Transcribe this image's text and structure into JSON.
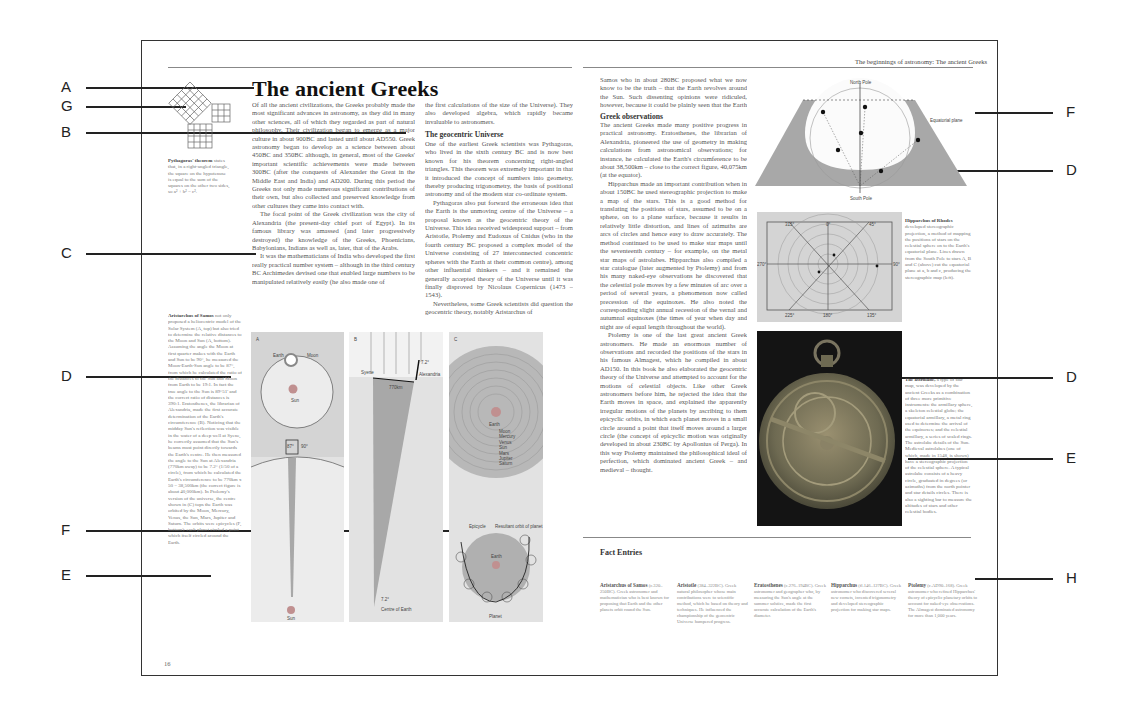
{
  "callouts_left": [
    {
      "letter": "A",
      "y": 87
    },
    {
      "letter": "G",
      "y": 106
    },
    {
      "letter": "B",
      "y": 132
    },
    {
      "letter": "C",
      "y": 253
    },
    {
      "letter": "D",
      "y": 376
    },
    {
      "letter": "F",
      "y": 530
    },
    {
      "letter": "E",
      "y": 575
    }
  ],
  "callouts_right": [
    {
      "letter": "F",
      "y": 112
    },
    {
      "letter": "D",
      "y": 170
    },
    {
      "letter": "D",
      "y": 377
    },
    {
      "letter": "E",
      "y": 458
    },
    {
      "letter": "H",
      "y": 578
    }
  ],
  "left_page": {
    "title": "The ancient Greeks",
    "page_number": "16",
    "intro_col1": "Of all the ancient civilizations, the Greeks probably made the most significant advances in astronomy, as they did in many other sciences, all of which they regarded as part of natural philosophy. Their civilization began to emerge as a major culture in about 900BC and lasted until about AD550. Greek astronomy began to develop as a science between about 450BC and 350BC although, in general, most of the Greeks' important scientific achievements were made between 300BC (after the conquests of Alexander the Great in the Middle East and India) and AD200. During this period the Greeks not only made numerous significant contributions of their own, but also collected and preserved knowledge from other cultures they came into contact with.",
    "intro_col1_p2": "The focal point of the Greek civilization was the city of Alexandria (the present-day chief port of Egypt). In its famous library was amassed (and later progressively destroyed) the knowledge of the Greeks, Phoenicians, Babylonians, Indians as well as, later, that of the Arabs.",
    "intro_col1_p3": "It was the mathematicians of India who developed the first really practical number system – although in the third century BC Archimedes devised one that enabled large numbers to be manipulated relatively easily (he also made one of",
    "col2_p1": "the first calculations of the size of the Universe). They also developed algebra, which rapidly became invaluable to astronomers.",
    "col2_heading": "The geocentric Universe",
    "col2_p2": "One of the earliest Greek scientists was Pythagoras, who lived in the sixth century BC and is now best known for his theorem concerning right-angled triangles. This theorem was extremely important in that it introduced the concept of numbers into geometry, thereby producing trigonometry, the basis of positional astronomy and of the modern star co-ordinate system.",
    "col2_p3": "Pythagoras also put forward the erroneous idea that the Earth is the unmoving centre of the Universe – a proposal known as the geocentric theory of the Universe. This idea received widespread support – from Aristotle, Ptolemy and Eudoxus of Cnidus (who in the fourth century BC proposed a complex model of the Universe consisting of 27 interconnected concentric spheres with the Earth at their common centre), among other influential thinkers – and it remained the generally accepted theory of the Universe until it was finally disproved by Nicolaus Copernicus (1473 – 1543).",
    "col2_p4": "Nevertheless, some Greek scientists did question the geocentric theory, notably Aristarchus of",
    "pythagoras_caption_title": "Pythagoras' theorem",
    "pythagoras_caption": "states that, in a right-angled triangle, the square on the hypotenuse is equal to the sum of the squares on the other two sides, so a² + b² = c².",
    "aristarchus_caption_title": "Aristarchus of Samos",
    "aristarchus_caption": "not only proposed a heliocentric model of the Solar System (A, top) but also tried to determine the relative distances to the Moon and Sun (A, bottom). Assuming the angle the Moon at first quarter makes with the Earth and Sun to be 90°, he measured the Moon-Earth-Sun angle to be 87°, from which he calculated the ratio of the distances to the Sun and Moon from Earth to be 19:1. In fact the true angle to the Sun is 89°51' and the correct ratio of distances is 390:1. Eratosthenes, the librarian of Alexandria, made the first accurate determination of the Earth's circumference (B). Noticing that the midday Sun's reflection was visible in the water of a deep well at Syene, he correctly assumed that the Sun's beams must point directly towards the Earth's centre. He then measured the angle to the Sun at Alexandria (770km away) to be 7.2° (1/50 of a circle), from which he calculated the Earth's circumference to be 770km x 50 = 38,500km (the correct figure is about 40,000km). In Ptolemy's version of the universe, the centre shown in (C) tops the Earth was orbited by the Moon, Mercury, Venus, the Sun, Mars, Jupiter and Saturn. The orbits were epicycles (F, bottom): each planet circled a point which itself circled around the Earth.",
    "diagram_panels": [
      {
        "id": "A",
        "labels": [
          "Earth",
          "Moon",
          "Sun",
          "87°",
          "90°",
          "Earth",
          "Moon",
          "Sun"
        ]
      },
      {
        "id": "B",
        "labels": [
          "Syene",
          "7.2°",
          "Alexandria",
          "770km",
          "7.2°",
          "Centre of Earth"
        ]
      },
      {
        "id": "C",
        "labels": [
          "Earth",
          "Moon",
          "Mercury",
          "Venus",
          "Sun",
          "Mars",
          "Jupiter",
          "Saturn",
          "Epicycle",
          "Resultant orbit of planet",
          "Earth",
          "Planet"
        ]
      }
    ]
  },
  "right_page": {
    "running_head": "The beginnings of astronomy: The ancient Greeks",
    "col1_p1": "Samos who in about 280BC proposed what we now know to be the truth – that the Earth revolves around the Sun. Such dissenting opinions were ridiculed, however, because it could be plainly seen that the Earth was stationary and that the celestial bodies revolved around it.",
    "col1_heading": "Greek observations",
    "col1_p2": "The ancient Greeks made many positive progress in practical astronomy. Eratosthenes, the librarian of Alexandria, pioneered the use of geometry in making calculations from astronomical observations; for instance, he calculated the Earth's circumference to be about 38,500km – close to the correct figure, 40,075km (at the equator).",
    "col1_p3": "Hipparchus made an important contribution when in about 150BC he used stereographic projection to make a map of the stars. This is a good method for translating the positions of stars, assumed to be on a sphere, on to a plane surface, because it results in relatively little distortion, and lines of azimuths are arcs of circles and hence easy to draw accurately. The method continued to be used to make star maps until the seventeenth century – for example, on the metal star maps of astrolabes. Hipparchus also compiled a star catalogue (later augmented by Ptolemy) and from his many naked-eye observations he discovered that the celestial pole moves by a few minutes of arc over a period of several years, a phenomenon now called precession of the equinoxes. He also noted the corresponding slight annual recession of the vernal and autumnal equinoxes (the times of year when day and night are of equal length throughout the world).",
    "col1_p4": "Ptolemy is one of the last great ancient Greek astronomers. He made an enormous number of observations and recorded the positions of the stars in his famous Almagest, which he compiled in about AD150. In this book he also elaborated the geocentric theory of the Universe and attempted to account for the motions of celestial objects. Like other Greek astronomers before him, he rejected the idea that the Earth moves in space, and explained the apparently irregular motions of the planets by ascribing to them epicyclic orbits, in which each planet moves in a small circle around a point that itself moves around a larger circle (the concept of epicyclic motion was originally developed in about 230BC by Apollonius of Perga). In this way Ptolemy maintained the philosophical ideal of perfection, which dominated ancient Greek – and medieval – thought.",
    "sphere_labels": {
      "north": "North Pole",
      "south": "South Pole",
      "plane": "Equatorial plane",
      "points": [
        "A",
        "B",
        "a",
        "b",
        "c",
        "C"
      ]
    },
    "stereo_labels": {
      "top": [
        "315°",
        "0°",
        "45°"
      ],
      "left": "270°",
      "right": "90°",
      "bottom": [
        "225°",
        "180°",
        "135°"
      ]
    },
    "hipparchus_caption_title": "Hipparchus of Rhodes",
    "hipparchus_caption": "developed stereographic projection, a method of mapping the positions of stars on the celestial sphere on to the Earth's equatorial plane. Lines drawn from the South Pole to stars A, B and C (above) cut the equatorial plane at a, b and c, producing the stereographic map (left).",
    "astrolabe_caption_title": "The astrolabe,",
    "astrolabe_caption": "a type of star map, was developed by the ancient Greeks as a combination of three more primitive instruments: the armillary sphere, a skeleton celestial globe; the equatorial armillary, a metal ring used to determine the arrival of the equinoxes; and the celestial armillary, a series of scaled rings. The astrolabe details of the Sun. Medieval astrolabes (one of which, made in 1548, is shown) have a stereographic projection of the celestial sphere. A typical astrolabe consists of a heavy circle, graduated in degrees (or azimuths) from the north pointer and star details circles. There is also a sighting bar to measure the altitudes of stars and other celestial bodies.",
    "fact_heading": "Fact Entries",
    "facts": [
      {
        "name": "Aristarchus of Samos",
        "text": "(c.320–250BC). Greek astronomer and mathematician who is best known for proposing that Earth and the other planets orbit round the Sun."
      },
      {
        "name": "Aristotle",
        "text": "(384–322BC). Greek natural philosopher whose main contributions were to scientific method, which he based on theory and techniques. He influenced the championship of the geocentric Universe hampered progress."
      },
      {
        "name": "Eratosthenes",
        "text": "(c.276–194BC). Greek astronomer and geographer who, by measuring the Sun's angle at the summer solstice, made the first accurate calculation of the Earth's diameter."
      },
      {
        "name": "Hipparchus",
        "text": "(fl.146–127BC). Greek astronomer who discovered several new comets, invented trigonometry and developed stereographic projection for making star maps."
      },
      {
        "name": "Ptolemy",
        "text": "(c.AD90–168). Greek astronomer who refined Hipparchus' theory of epicyclic planetary orbits to account for naked-eye observations. The Almagest dominated astronomy for more than 1,000 years."
      }
    ]
  },
  "colors": {
    "panel": "#d9d9d9",
    "panel_dark": "#a8a8a8",
    "frame": "#333333",
    "photo_bg": "#141414"
  }
}
